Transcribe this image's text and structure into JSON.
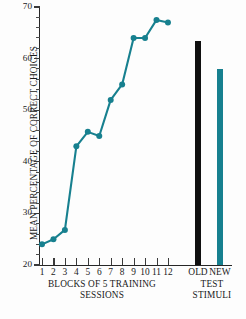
{
  "chart_data": {
    "type": "line",
    "title": "",
    "xlabel": "BLOCKS OF 5 TRAINING SESSIONS",
    "ylabel": "MEAN PERCENTAGE OF CORRECT CHOICES",
    "ylim": [
      20,
      70
    ],
    "ytick_labels": [
      "20",
      "30",
      "40",
      "50",
      "60",
      "70"
    ],
    "ytick_values": [
      20,
      30,
      40,
      50,
      60,
      70
    ],
    "yminor_step": 2,
    "grid": false,
    "legend": "none",
    "categories": [
      "1",
      "2",
      "3",
      "4",
      "5",
      "6",
      "7",
      "8",
      "9",
      "10",
      "11",
      "12"
    ],
    "series": [
      {
        "name": "Training blocks",
        "type": "line",
        "color": "#17808f",
        "values": [
          24.0,
          25.0,
          26.8,
          43.0,
          45.8,
          45.0,
          52.0,
          55.0,
          64.0,
          64.0,
          67.5,
          67.0
        ]
      }
    ],
    "bars": {
      "categories": [
        "OLD",
        "NEW"
      ],
      "values": [
        63.5,
        58.0
      ],
      "colors": [
        "#101010",
        "#17808f"
      ],
      "group_label": "TEST STIMULI"
    }
  },
  "axes": {
    "y_title": "MEAN PERCENTAGE OF CORRECT CHOICES",
    "x_caption_training_line1": "BLOCKS OF 5 TRAINING",
    "x_caption_training_line2": "SESSIONS",
    "x_caption_test_line1": "TEST",
    "x_caption_test_line2": "STIMULI",
    "x_tick_labels": [
      "1",
      "2",
      "3",
      "4",
      "5",
      "6",
      "7",
      "8",
      "9",
      "10",
      "11",
      "12",
      "OLD",
      "NEW"
    ]
  },
  "colors": {
    "accent_teal": "#17808f",
    "bar_black": "#101010",
    "axis": "#262626",
    "background": "#fdfdfd"
  }
}
